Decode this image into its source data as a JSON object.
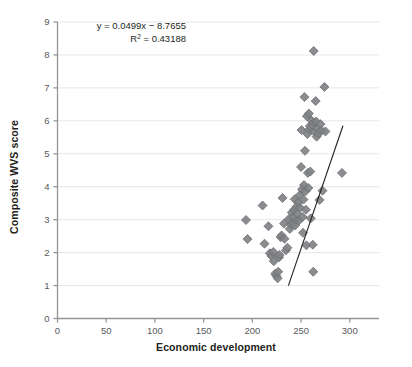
{
  "chart_data": {
    "type": "scatter",
    "title": "",
    "xlabel": "Economic development",
    "ylabel": "Composite WVS score",
    "xlim": [
      0,
      330
    ],
    "ylim": [
      0,
      9
    ],
    "xticks": [
      0,
      50,
      100,
      150,
      200,
      250,
      300
    ],
    "yticks": [
      0,
      1,
      2,
      3,
      4,
      5,
      6,
      7,
      8,
      9
    ],
    "grid": "horizontal",
    "legend": "none",
    "marker": {
      "shape": "diamond",
      "color": "#808285",
      "edge_color": "#6d6e71",
      "size_px": 9
    },
    "annotations": [
      {
        "name": "regression-equation",
        "text": "y = 0.0499x − 8.7655"
      },
      {
        "name": "r-squared",
        "text_prefix": "R",
        "text_sup": "2",
        "text_suffix": " = 0.43188"
      }
    ],
    "trendline": {
      "type": "linear",
      "slope": 0.0499,
      "intercept": -8.7655,
      "r_squared": 0.43188,
      "color": "#231f20",
      "x_start": 237,
      "x_end": 293,
      "y_start": 1.0,
      "y_end": 5.85
    },
    "points": [
      [
        193.5,
        2.99
      ],
      [
        195.0,
        2.41
      ],
      [
        210.5,
        3.43
      ],
      [
        212.5,
        2.27
      ],
      [
        216.5,
        2.8
      ],
      [
        218.0,
        1.98
      ],
      [
        219.5,
        1.9
      ],
      [
        221.5,
        2.02
      ],
      [
        222.0,
        1.74
      ],
      [
        223.5,
        1.36
      ],
      [
        224.5,
        1.3
      ],
      [
        226.0,
        1.22
      ],
      [
        226.5,
        1.42
      ],
      [
        227.5,
        1.86
      ],
      [
        228.0,
        1.93
      ],
      [
        229.0,
        2.47
      ],
      [
        230.0,
        2.52
      ],
      [
        231.0,
        3.66
      ],
      [
        232.5,
        2.88
      ],
      [
        233.0,
        2.42
      ],
      [
        234.5,
        2.07
      ],
      [
        236.0,
        2.15
      ],
      [
        237.5,
        3.02
      ],
      [
        238.5,
        2.72
      ],
      [
        239.5,
        2.86
      ],
      [
        240.5,
        3.22
      ],
      [
        241.5,
        3.06
      ],
      [
        242.0,
        2.88
      ],
      [
        243.0,
        3.3
      ],
      [
        243.5,
        3.62
      ],
      [
        244.0,
        2.83
      ],
      [
        245.0,
        3.0
      ],
      [
        245.5,
        3.4
      ],
      [
        246.5,
        3.18
      ],
      [
        247.0,
        3.52
      ],
      [
        248.0,
        2.98
      ],
      [
        248.5,
        3.74
      ],
      [
        249.0,
        3.36
      ],
      [
        250.0,
        4.6
      ],
      [
        250.5,
        5.72
      ],
      [
        251.0,
        3.92
      ],
      [
        251.5,
        3.08
      ],
      [
        252.0,
        2.6
      ],
      [
        252.5,
        3.61
      ],
      [
        253.0,
        4.05
      ],
      [
        253.5,
        6.72
      ],
      [
        254.0,
        5.09
      ],
      [
        254.5,
        3.86
      ],
      [
        255.0,
        3.3
      ],
      [
        255.5,
        2.22
      ],
      [
        256.0,
        6.14
      ],
      [
        256.5,
        5.6
      ],
      [
        257.0,
        4.42
      ],
      [
        257.5,
        3.96
      ],
      [
        258.0,
        6.22
      ],
      [
        258.5,
        5.74
      ],
      [
        259.0,
        5.84
      ],
      [
        259.5,
        4.46
      ],
      [
        260.0,
        3.04
      ],
      [
        261.0,
        6.0
      ],
      [
        261.5,
        5.88
      ],
      [
        262.0,
        2.24
      ],
      [
        262.5,
        1.42
      ],
      [
        263.0,
        8.12
      ],
      [
        263.5,
        5.95
      ],
      [
        264.0,
        5.66
      ],
      [
        265.0,
        6.6
      ],
      [
        265.5,
        5.98
      ],
      [
        266.0,
        5.52
      ],
      [
        267.0,
        5.76
      ],
      [
        268.0,
        5.62
      ],
      [
        269.0,
        3.6
      ],
      [
        270.0,
        5.9
      ],
      [
        271.0,
        5.7
      ],
      [
        272.0,
        3.88
      ],
      [
        274.0,
        7.03
      ],
      [
        275.0,
        5.68
      ],
      [
        292.0,
        4.42
      ]
    ]
  },
  "axes": {
    "x_title": "Economic development",
    "y_title": "Composite WVS score",
    "x_tick_labels": [
      "0",
      "50",
      "100",
      "150",
      "200",
      "250",
      "300"
    ],
    "y_tick_labels": [
      "0",
      "1",
      "2",
      "3",
      "4",
      "5",
      "6",
      "7",
      "8",
      "9"
    ]
  },
  "annotation_text": {
    "equation": "y = 0.0499x − 8.7655",
    "r2_prefix": "R",
    "r2_sup": "2",
    "r2_suffix": " = 0.43188"
  },
  "colors": {
    "marker_fill": "#808285",
    "marker_edge": "#6d6e71",
    "grid": "#e6e7e8",
    "axis": "#939598",
    "trendline": "#231f20",
    "text": "#231f20"
  }
}
